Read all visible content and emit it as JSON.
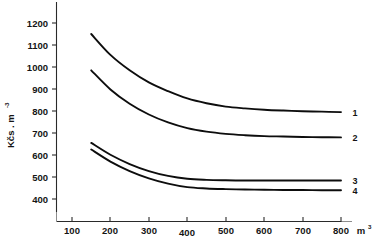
{
  "chart_data": {
    "type": "line",
    "title": "",
    "xlabel": "m3",
    "ylabel": "Kčs . m",
    "ylabel_superscript": "-3",
    "xlabel_superscript": "3",
    "xlim": [
      100,
      800
    ],
    "ylim": [
      350,
      1250
    ],
    "grid": false,
    "legend_position": "right-inline",
    "x_ticks": [
      100,
      200,
      300,
      400,
      500,
      600,
      700,
      800
    ],
    "y_ticks": [
      400,
      500,
      600,
      700,
      800,
      900,
      1000,
      1100,
      1200
    ],
    "x": [
      150,
      200,
      250,
      300,
      350,
      400,
      450,
      500,
      550,
      600,
      650,
      700,
      750,
      800
    ],
    "series": [
      {
        "name": "1",
        "label": "1",
        "values": [
          1150,
          1055,
          985,
          930,
          890,
          857,
          835,
          820,
          812,
          806,
          802,
          799,
          797,
          795
        ]
      },
      {
        "name": "2",
        "label": "2",
        "values": [
          985,
          898,
          833,
          784,
          748,
          722,
          706,
          696,
          690,
          686,
          684,
          682,
          681,
          680
        ]
      },
      {
        "name": "3",
        "label": "3",
        "values": [
          655,
          601,
          559,
          527,
          505,
          492,
          487,
          485,
          484,
          484,
          484,
          484,
          484,
          484
        ]
      },
      {
        "name": "4",
        "label": "4",
        "values": [
          625,
          570,
          527,
          494,
          470,
          454,
          448,
          445,
          443,
          442,
          441,
          441,
          440,
          440
        ]
      }
    ]
  },
  "axes": {
    "x_tick_labels": [
      "100",
      "200",
      "300",
      "400",
      "500",
      "600",
      "700",
      "800"
    ],
    "y_tick_labels": [
      "400",
      "500",
      "600",
      "700",
      "800",
      "900",
      "1000",
      "1100",
      "1200"
    ],
    "x_unit": "m",
    "x_unit_sup": "3",
    "y_unit": "Kčs . m",
    "y_unit_sup": "-3"
  },
  "series_labels": [
    "1",
    "2",
    "3",
    "4"
  ],
  "colors": {
    "curve": "#0d0d0d",
    "axis": "#2a2a2a",
    "text": "#141414",
    "background": "#ffffff"
  }
}
